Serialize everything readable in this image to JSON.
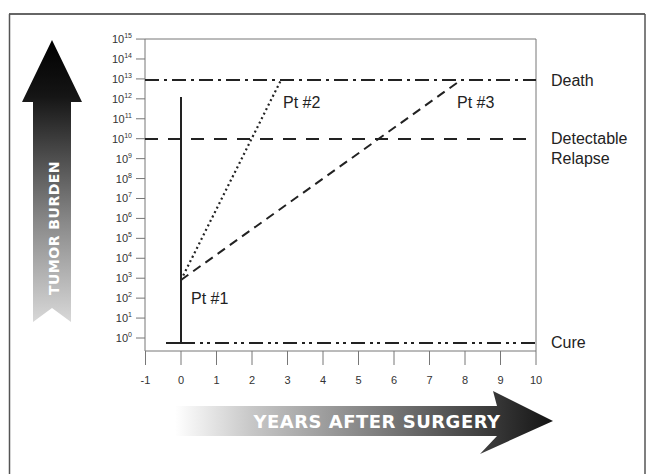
{
  "chart_data": {
    "type": "line",
    "title": "",
    "xlabel": "Years After Surgery",
    "ylabel": "Tumor Burden",
    "x_ticks": [
      -1,
      0,
      1,
      2,
      3,
      4,
      5,
      6,
      7,
      8,
      9,
      10
    ],
    "y_scale": "log10",
    "y_tick_exponents": [
      0,
      1,
      2,
      3,
      4,
      5,
      6,
      7,
      8,
      9,
      10,
      11,
      12,
      13,
      14,
      15
    ],
    "xlim": [
      -1,
      10
    ],
    "ylim_exponent": [
      -0.6,
      15
    ],
    "grid": false,
    "thresholds": [
      {
        "name": "Death",
        "exponent": 13,
        "style": "dash-dot"
      },
      {
        "name": "Detectable Relapse",
        "exponent": 10,
        "style": "dashed"
      },
      {
        "name": "Cure",
        "exponent": -0.25,
        "style": "dash-dot-dot"
      }
    ],
    "series": [
      {
        "name": "Pt #1",
        "style": "solid",
        "points": [
          {
            "x": -0.3,
            "exp": -0.25
          },
          {
            "x": 0,
            "exp": -0.25
          },
          {
            "x": 0,
            "exp": 12.1
          }
        ]
      },
      {
        "name": "Pt #2",
        "style": "dotted",
        "points": [
          {
            "x": 0,
            "exp": 2.95
          },
          {
            "x": 2.8,
            "exp": 13
          }
        ]
      },
      {
        "name": "Pt #3",
        "style": "dashed",
        "points": [
          {
            "x": 0,
            "exp": 2.95
          },
          {
            "x": 7.9,
            "exp": 13
          }
        ]
      }
    ],
    "annotations": [
      {
        "text": "Pt #1",
        "x": 0.3,
        "exp": 1.9
      },
      {
        "text": "Pt #2",
        "x": 2.9,
        "exp": 11.9
      },
      {
        "text": "Pt #3",
        "x": 8.0,
        "exp": 11.9
      }
    ]
  },
  "labels": {
    "y_axis_title": "Tumor Burden",
    "x_axis_title": "Years After Surgery",
    "death": "Death",
    "relapse_line1": "Detectable",
    "relapse_line2": "Relapse",
    "cure": "Cure",
    "pt1": "Pt #1",
    "pt2": "Pt #2",
    "pt3": "Pt #3"
  }
}
